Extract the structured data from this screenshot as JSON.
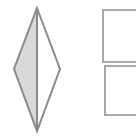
{
  "figure": {
    "background_color": "#ffffff",
    "canvas": {
      "width": 136,
      "height": 138
    },
    "stroke_color": "#8a8a8a",
    "stroke_color_light": "#a8a8a8",
    "fill_gray": "#d9d9d9",
    "fill_white": "#ffffff",
    "stroke_width": 2,
    "shapes": [
      {
        "name": "rhombus",
        "type": "polygon",
        "label": "Vertical diamond split by a center line",
        "vertices": [
          {
            "x": 37,
            "y": 8
          },
          {
            "x": 60,
            "y": 69
          },
          {
            "x": 37,
            "y": 131
          },
          {
            "x": 14,
            "y": 69
          }
        ],
        "left_half_fill": "#d9d9d9",
        "right_half_fill": "#ffffff",
        "center_line": {
          "x1": 37,
          "y1": 8,
          "x2": 37,
          "y2": 131
        }
      },
      {
        "name": "upper-rectangle",
        "type": "rect",
        "label": "Upper rectangle, clipped at right edge",
        "x": 103,
        "y": 10,
        "width": 52,
        "height": 52,
        "fill": "#ffffff"
      },
      {
        "name": "lower-rectangle",
        "type": "rect",
        "label": "Lower rectangle, clipped at right edge",
        "x": 105,
        "y": 66,
        "width": 50,
        "height": 49,
        "fill": "#ffffff"
      }
    ]
  }
}
